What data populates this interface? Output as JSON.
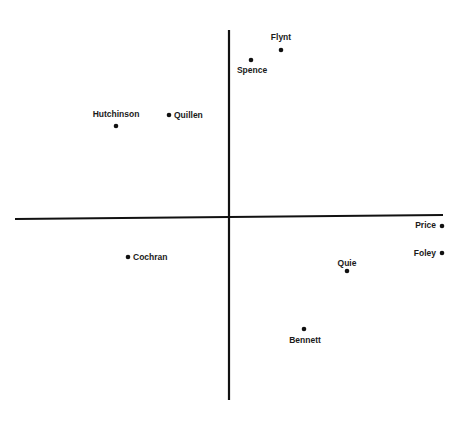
{
  "chart_data": {
    "type": "scatter",
    "title": "",
    "xlabel": "",
    "ylabel": "",
    "grid": false,
    "legend": null,
    "axes": {
      "vertical": {
        "x": 229,
        "y1": 30,
        "y2": 400
      },
      "horizontal": {
        "x1": 15,
        "y1": 219,
        "x2": 443,
        "y2": 215
      }
    },
    "points": [
      {
        "name": "Flynt",
        "px": 281,
        "py": 50,
        "lx": 281,
        "ly": 40,
        "anchor": "middle"
      },
      {
        "name": "Spence",
        "px": 251,
        "py": 60,
        "lx": 252,
        "ly": 73,
        "anchor": "middle"
      },
      {
        "name": "Hutchinson",
        "px": 116,
        "py": 126,
        "lx": 116,
        "ly": 117,
        "anchor": "middle"
      },
      {
        "name": "Quillen",
        "px": 169,
        "py": 115,
        "lx": 174,
        "ly": 118,
        "anchor": "start"
      },
      {
        "name": "Price",
        "px": 442,
        "py": 226,
        "lx": 436,
        "ly": 228,
        "anchor": "end"
      },
      {
        "name": "Foley",
        "px": 442,
        "py": 253,
        "lx": 436,
        "ly": 256,
        "anchor": "end"
      },
      {
        "name": "Cochran",
        "px": 128,
        "py": 257,
        "lx": 133,
        "ly": 260,
        "anchor": "start"
      },
      {
        "name": "Quie",
        "px": 347,
        "py": 271,
        "lx": 347,
        "ly": 266,
        "anchor": "middle"
      },
      {
        "name": "Bennett",
        "px": 304,
        "py": 329,
        "lx": 305,
        "ly": 343,
        "anchor": "middle"
      }
    ],
    "x": [
      0.28,
      0.12,
      -0.62,
      -0.32,
      1.12,
      1.12,
      -0.55,
      0.63,
      0.41
    ],
    "y": [
      0.94,
      0.88,
      0.51,
      0.57,
      -0.05,
      -0.2,
      -0.22,
      -0.3,
      -0.62
    ],
    "labels": [
      "Flynt",
      "Spence",
      "Hutchinson",
      "Quillen",
      "Price",
      "Foley",
      "Cochran",
      "Quie",
      "Bennett"
    ]
  }
}
